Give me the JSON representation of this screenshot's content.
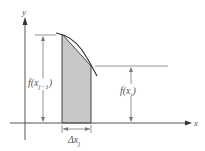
{
  "diagram": {
    "type": "riemann-trapezoid-strip",
    "axes": {
      "x_label": "x",
      "y_label": "y"
    },
    "labels": {
      "left_height": "f(x",
      "left_height_sub": "j−1",
      "left_height_close": ")",
      "right_height": "f(x",
      "right_height_sub": "j",
      "right_height_close": ")",
      "width": "Δx",
      "width_sub": "j"
    },
    "colors": {
      "shade": "#c8c8c8",
      "line": "#555555",
      "curve": "#333333"
    }
  }
}
